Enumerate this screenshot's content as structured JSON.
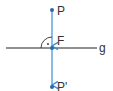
{
  "diagram": {
    "colors": {
      "line_g": "#222222",
      "perpendicular": "#3a8fd6",
      "point": "#2a6aa8",
      "text": "#333333"
    },
    "points": {
      "P": {
        "label": "P",
        "x": 52,
        "y": 10
      },
      "F": {
        "label": "F",
        "x": 52,
        "y": 48
      },
      "P_prime": {
        "label": "P'",
        "x": 52,
        "y": 87
      }
    },
    "line": {
      "label": "g"
    },
    "right_angle_marker": "·"
  }
}
